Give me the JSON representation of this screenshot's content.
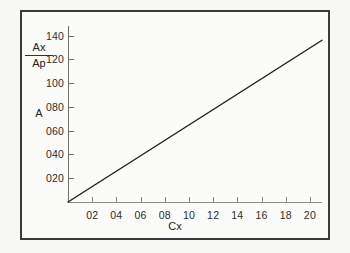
{
  "chart_data": {
    "type": "line",
    "title": "",
    "xlabel": "Cx",
    "ylabel": "Ax/Ap",
    "ylabel_numerator": "Ax",
    "ylabel_denominator": "Ap",
    "ylabel_secondary": "A",
    "xlim": [
      0,
      21
    ],
    "ylim": [
      0,
      148
    ],
    "grid": false,
    "legend": "none",
    "xticks": [
      2,
      4,
      6,
      8,
      10,
      12,
      14,
      16,
      18,
      20
    ],
    "xtick_labels": [
      "02",
      "04",
      "06",
      "08",
      "10",
      "12",
      "14",
      "16",
      "18",
      "20"
    ],
    "yticks": [
      20,
      40,
      60,
      80,
      100,
      120,
      140
    ],
    "ytick_labels": [
      "020",
      "040",
      "060",
      "080",
      "100",
      "120",
      "140"
    ],
    "series": [
      {
        "name": "Ax/Ap vs Cx",
        "x": [
          0,
          21
        ],
        "values": [
          0,
          136
        ],
        "color": "#1d1d1d"
      }
    ]
  },
  "figure": {
    "background": "#f7f7f5",
    "panel_background": "#fbfbfa",
    "frame_color": "#3a3a3a",
    "axis_color": "#6e6e6e",
    "text_color": "#2d2d2d"
  }
}
